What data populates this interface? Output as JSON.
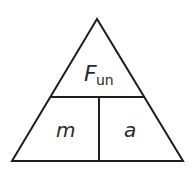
{
  "diagram": {
    "type": "formula-triangle",
    "top": {
      "symbol": "F",
      "subscript": "un"
    },
    "bottom_left": {
      "symbol": "m"
    },
    "bottom_right": {
      "symbol": "a"
    },
    "stroke_color": "#1e1e1e"
  }
}
